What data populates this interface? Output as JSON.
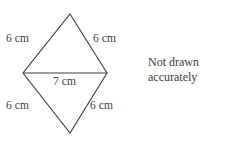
{
  "figure": {
    "type": "rhombus-two-triangles",
    "stroke_color": "#3d3d3d",
    "background_color": "#ffffff",
    "vertices": {
      "top": [
        70,
        14
      ],
      "left": [
        23,
        73
      ],
      "right": [
        107,
        73
      ],
      "bottom": [
        70,
        133
      ]
    },
    "labels": {
      "top_left_side": "6 cm",
      "top_right_side": "6 cm",
      "horizontal_diagonal": "7 cm",
      "bottom_left_side": "6 cm",
      "bottom_right_side": "6 cm"
    }
  },
  "note": {
    "line1": "Not drawn",
    "line2": "accurately"
  }
}
